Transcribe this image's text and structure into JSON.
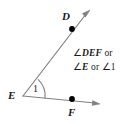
{
  "figure": {
    "type": "geometry-angle-diagram",
    "background_color": "#ffffff",
    "line_color": "#808080",
    "point_color": "#000000",
    "text_color": "#1a1a1a",
    "points": [
      {
        "name": "D",
        "label": "D",
        "x": 72,
        "y": 29
      },
      {
        "name": "E",
        "label": "E",
        "x": 23,
        "y": 96
      },
      {
        "name": "F",
        "label": "F",
        "x": 72,
        "y": 99
      }
    ],
    "rays": [
      {
        "name": "ray-ED",
        "from": "E",
        "through": "D",
        "arrow_tip_x": 90,
        "arrow_tip_y": 10
      },
      {
        "name": "ray-EF",
        "from": "E",
        "through": "F",
        "arrow_tip_x": 100,
        "arrow_tip_y": 104
      }
    ],
    "angle_arc": {
      "vertex": "E",
      "label": "1"
    },
    "annotation": {
      "line1": {
        "angle_symbol": "∠",
        "name": "DEF",
        "conjunction": "or"
      },
      "line2": {
        "angle_symbol_1": "∠",
        "name_1": "E",
        "conjunction": "or",
        "angle_symbol_2": "∠",
        "name_2": "1"
      }
    }
  }
}
